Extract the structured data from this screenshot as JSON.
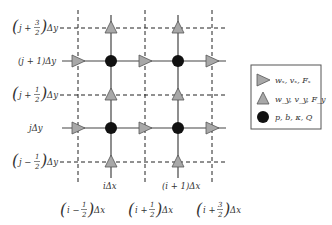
{
  "diagram": {
    "y_labels": [
      {
        "id": "j+3/2",
        "prefix": "j + ",
        "num": "3",
        "den": "2",
        "suffix": "Δy",
        "y": 28
      },
      {
        "id": "j+1",
        "text": "(j + 1)Δy",
        "y": 61
      },
      {
        "id": "j+1/2",
        "prefix": "j + ",
        "num": "1",
        "den": "2",
        "suffix": "Δy",
        "y": 95
      },
      {
        "id": "j",
        "text": "jΔy",
        "y": 128
      },
      {
        "id": "j-1/2",
        "prefix": "j − ",
        "num": "1",
        "den": "2",
        "suffix": "Δy",
        "y": 162
      }
    ],
    "x_labels": [
      {
        "id": "i",
        "text": "iΔx",
        "x": 111
      },
      {
        "id": "i+1",
        "text": "(i + 1)Δx",
        "x": 178
      },
      {
        "id": "i-1/2",
        "prefix": "i − ",
        "num": "1",
        "den": "2",
        "suffix": "Δx",
        "x": 78
      },
      {
        "id": "i+1/2",
        "prefix": "i + ",
        "num": "1",
        "den": "2",
        "suffix": "Δx",
        "x": 145
      },
      {
        "id": "i+3/2",
        "prefix": "i + ",
        "num": "3",
        "den": "2",
        "suffix": "Δx",
        "x": 212
      }
    ],
    "legend": [
      {
        "symbol": "right-triangle",
        "label": "wₓ, vₓ, Fₓ",
        "color": "#a8a8a8"
      },
      {
        "symbol": "up-triangle",
        "label": "w_y, v_y, F_y",
        "color": "#a8a8a8"
      },
      {
        "symbol": "dot",
        "label": "p, b, κ, Q",
        "color": "#111111"
      }
    ],
    "colors": {
      "marker_fill": "#a8a8a8",
      "marker_stroke": "#555555",
      "dot": "#111111",
      "line": "#444444",
      "dash": "#222222"
    }
  }
}
